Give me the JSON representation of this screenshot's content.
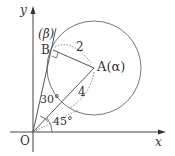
{
  "diagram": {
    "axes": {
      "x_label": "x",
      "y_label": "y",
      "origin_label": "O"
    },
    "points": {
      "A": {
        "label": "A(α)",
        "name": "A",
        "complex": "α"
      },
      "B": {
        "label": "B",
        "name": "B"
      },
      "beta": {
        "label": "(β)"
      }
    },
    "segments": {
      "AB_length": "2",
      "OA_length": "4"
    },
    "angles": {
      "AOB": "30°",
      "xOA": "45°"
    },
    "circle": {
      "center": "A",
      "radius": "2"
    },
    "right_angle_at": "B"
  }
}
